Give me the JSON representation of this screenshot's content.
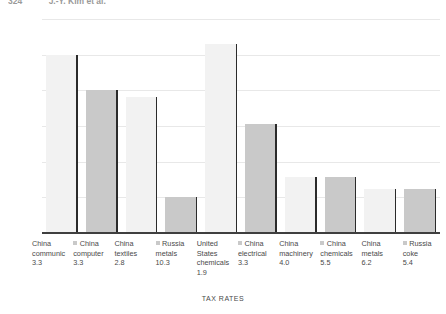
{
  "page_header": {
    "page_number": "324",
    "running_head": "J.-Y. Kim et al."
  },
  "chart_data": {
    "type": "bar",
    "title": "",
    "xlabel": "TAX RATES",
    "ylabel": "TRADE VOLUME",
    "ylim": [
      0,
      30
    ],
    "ytick_labels": [
      "30",
      "25",
      "20",
      "15",
      "10",
      "5",
      "0"
    ],
    "ytick_values": [
      30,
      25,
      20,
      15,
      10,
      5,
      0
    ],
    "grid": true,
    "legend_position": "inline-with-category-labels",
    "categories": [
      "China communic",
      "China computer",
      "China textiles",
      "Russia metals",
      "United States chemicals",
      "China electrical",
      "China machinery",
      "China chemicals",
      "China metals",
      "Russia coke"
    ],
    "tax_rates": [
      3.3,
      3.3,
      2.8,
      10.3,
      1.9,
      3.3,
      4.0,
      5.5,
      6.2,
      5.4
    ],
    "values": [
      25.0,
      20.0,
      19.0,
      5.0,
      26.5,
      15.3,
      7.8,
      7.8,
      6.2,
      6.2
    ],
    "bar_colors": [
      "#f2f2f2",
      "#c9c9c9",
      "#f2f2f2",
      "#c9c9c9",
      "#f2f2f2",
      "#c9c9c9",
      "#f2f2f2",
      "#c9c9c9",
      "#f2f2f2",
      "#c9c9c9"
    ],
    "edge_color": "#2b2b2b",
    "grid_color": "#e8e8e8",
    "axis_color": "#3f3f3f"
  },
  "axis": {
    "x_title": "TAX RATES",
    "y_title": "TRADE VOLUME"
  },
  "categories_detail": [
    {
      "line1": "China",
      "line2": "communic",
      "line3": "",
      "rate": "3.3",
      "swatch": false
    },
    {
      "line1": "China",
      "line2": "computer",
      "line3": "",
      "rate": "3.3",
      "swatch": true
    },
    {
      "line1": "China",
      "line2": "textiles",
      "line3": "",
      "rate": "2.8",
      "swatch": false
    },
    {
      "line1": "Russia",
      "line2": "metals",
      "line3": "",
      "rate": "10.3",
      "swatch": true
    },
    {
      "line1": "United",
      "line2": "States",
      "line3": "chemicals",
      "rate": "1.9",
      "swatch": false
    },
    {
      "line1": "China",
      "line2": "electrical",
      "line3": "",
      "rate": "3.3",
      "swatch": true
    },
    {
      "line1": "China",
      "line2": "machinery",
      "line3": "",
      "rate": "4.0",
      "swatch": false
    },
    {
      "line1": "China",
      "line2": "chemicals",
      "line3": "",
      "rate": "5.5",
      "swatch": true
    },
    {
      "line1": "China",
      "line2": "metals",
      "line3": "",
      "rate": "6.2",
      "swatch": false
    },
    {
      "line1": "Russia",
      "line2": "coke",
      "line3": "",
      "rate": "5.4",
      "swatch": true
    }
  ]
}
